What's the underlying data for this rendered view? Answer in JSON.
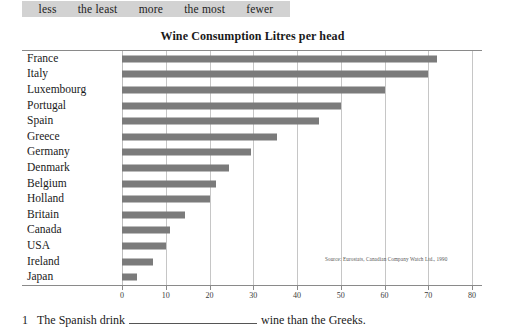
{
  "word_bank": {
    "words": [
      "less",
      "the least",
      "more",
      "the most",
      "fewer"
    ]
  },
  "chart_data": {
    "type": "bar",
    "orientation": "horizontal",
    "title": "Wine Consumption Litres per head",
    "xlabel": "",
    "ylabel": "",
    "xlim": [
      0,
      80
    ],
    "grid": true,
    "legend": null,
    "source_note": "Source: Eurostats, Canadian Company Watch Ltd., 1990",
    "xticks": [
      0,
      10,
      20,
      30,
      40,
      50,
      60,
      70,
      80
    ],
    "xtick_labels": [
      "0",
      "10",
      "20",
      "30",
      "40",
      "50",
      "60",
      "70",
      "80"
    ],
    "categories": [
      "France",
      "Italy",
      "Luxembourg",
      "Portugal",
      "Spain",
      "Greece",
      "Germany",
      "Denmark",
      "Belgium",
      "Holland",
      "Britain",
      "Canada",
      "USA",
      "Ireland",
      "Japan"
    ],
    "values": [
      72,
      70,
      60,
      50,
      45,
      35.5,
      29.5,
      24.5,
      21.5,
      20,
      14.5,
      11,
      10,
      7,
      3.5
    ],
    "bar_color": "#7b7b7b",
    "grid_color": "#c6c6c6"
  },
  "exercise": {
    "number": "1",
    "text_before": "The Spanish drink",
    "text_after": "wine than the Greeks."
  }
}
